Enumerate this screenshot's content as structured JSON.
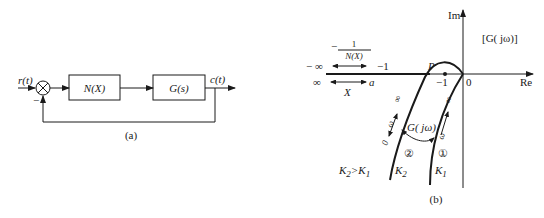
{
  "figure_a": {
    "caption": "(a)",
    "input_label": "r(t)",
    "output_label": "c(t)",
    "feedback_sign": "−",
    "blocks": [
      {
        "label": "N(X)"
      },
      {
        "label": "G(s)"
      }
    ]
  },
  "figure_b": {
    "caption": "(b)",
    "axis_im": "Im",
    "axis_re": "Re",
    "origin_label": "0",
    "minus_one_label": "−1",
    "point_p": "P",
    "plot_label": "[G( jω)]",
    "describing_fn": {
      "neg": "−",
      "numerator": "1",
      "denominator": "N(X)",
      "left_end": "− ∞",
      "right_end": "−1"
    },
    "amplitude": {
      "left_end": "∞",
      "right_end": "a",
      "var": "X"
    },
    "curve_label": "G( jω)",
    "curve1": {
      "id": "①",
      "gain": "K",
      "gain_sub": "1",
      "omega": "ω",
      "inf": "∞"
    },
    "curve2": {
      "id": "②",
      "gain": "K",
      "gain_sub": "2",
      "omega": "ω",
      "inf": "∞",
      "zero": "0"
    },
    "condition": {
      "k2": "K",
      "k2sub": "2",
      "gt": ">",
      "k1": "K",
      "k1sub": "1"
    }
  }
}
